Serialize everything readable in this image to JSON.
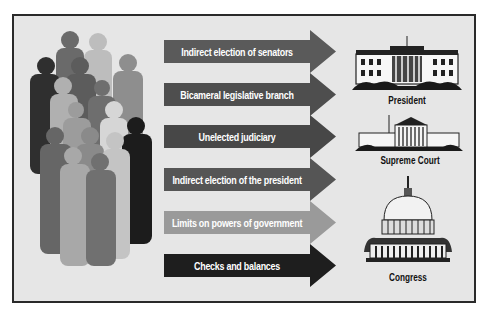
{
  "diagram": {
    "title": "",
    "left_graphic": "crowd-of-people-silhouettes",
    "arrows": [
      {
        "label": "Indirect election of senators",
        "color": "#5a5a5a"
      },
      {
        "label": "Bicameral legislative branch",
        "color": "#4e4e4e"
      },
      {
        "label": "Unelected judiciary",
        "color": "#474747"
      },
      {
        "label": "Indirect election of the president",
        "color": "#555555"
      },
      {
        "label": "Limits on powers of government",
        "color": "#9a9a9a"
      },
      {
        "label": "Checks and balances",
        "color": "#1e1e1e"
      }
    ],
    "buildings": [
      {
        "icon": "white-house-icon",
        "caption": "President"
      },
      {
        "icon": "supreme-court-icon",
        "caption": "Supreme Court"
      },
      {
        "icon": "capitol-icon",
        "caption": "Congress"
      }
    ],
    "colors": {
      "background": "#e6e6e6",
      "frame": "#2a2a2a"
    }
  }
}
